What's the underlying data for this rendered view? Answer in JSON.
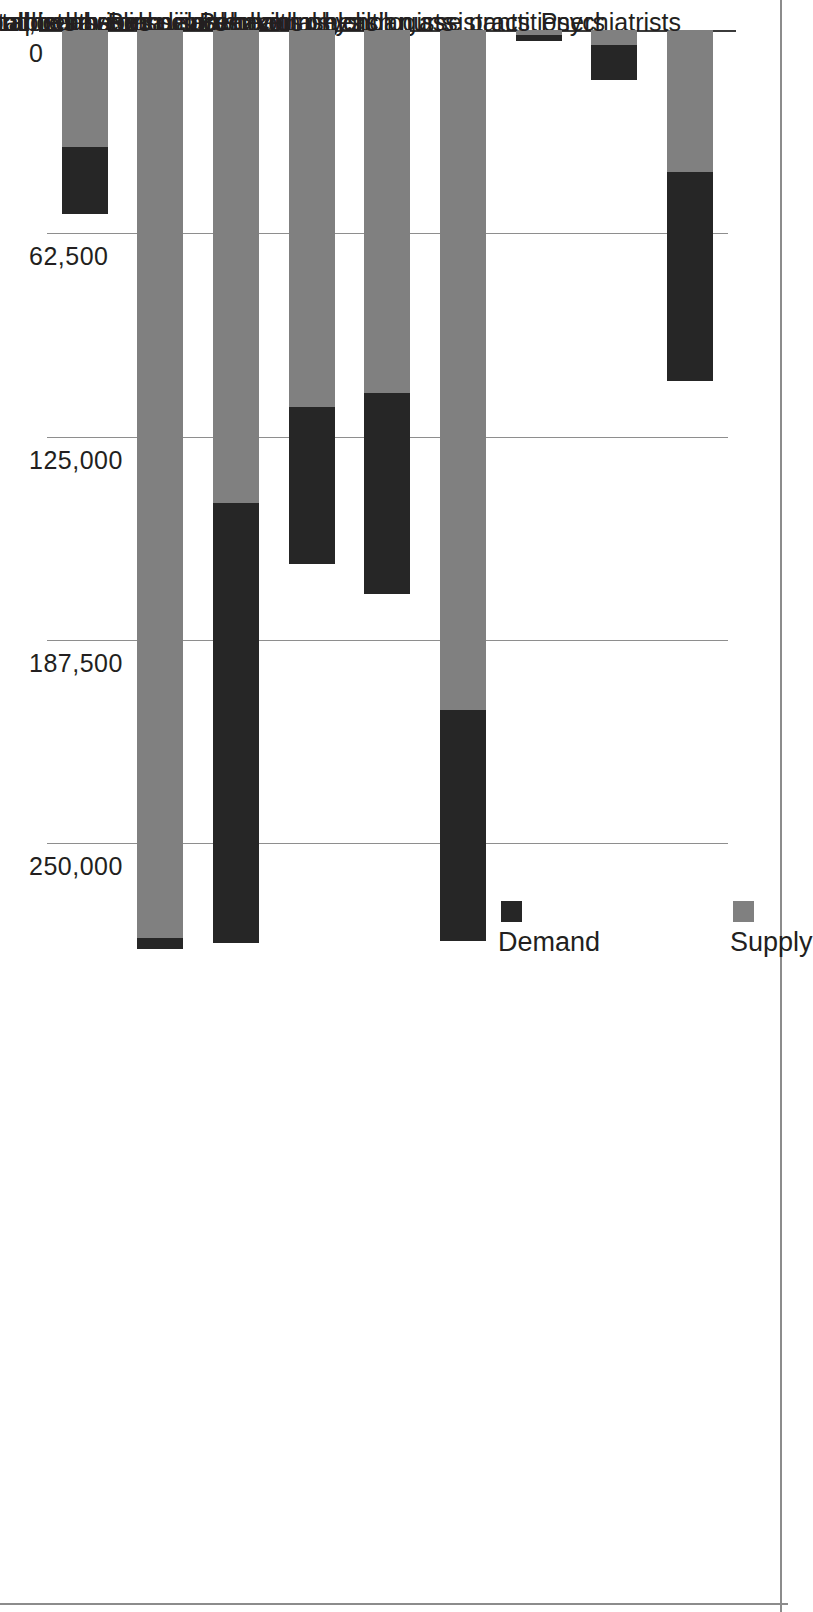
{
  "chart_data": {
    "type": "bar",
    "subtype": "stacked-bar",
    "orientation": "vertical-rotated",
    "title": "",
    "subtitle": "",
    "xlabel": "",
    "ylabel": "",
    "grid": true,
    "legend_position": "top-left",
    "ylim": [
      0,
      280000
    ],
    "categories": [
      "Psychiatrists",
      "Behavioral health nurse practitioners",
      "Behavioral health physician assistants",
      "Clinical, counseling, and school psychologists",
      "Substance abuse and behavioral disorder counselors",
      "Mental health and substance abuse social workers",
      "Mental health counselors",
      "School counselors",
      "Marriage and family therapists"
    ],
    "series": [
      {
        "name": "Supply",
        "color": "#808080",
        "values": [
          43500,
          4500,
          1500,
          209000,
          111500,
          116000,
          145500,
          279000,
          36000
        ]
      },
      {
        "name": "Demand",
        "color": "#262626",
        "values": [
          64500,
          11000,
          2000,
          71000,
          62000,
          48000,
          135000,
          3500,
          20500
        ]
      }
    ],
    "totals": [
      108000,
      15500,
      3500,
      280000,
      173500,
      164000,
      280500,
      282500,
      56500
    ],
    "ticks": [
      {
        "label": "0",
        "value": 0
      },
      {
        "label": "62,500",
        "value": 62500
      },
      {
        "label": "125,000",
        "value": 125000
      },
      {
        "label": "187,500",
        "value": 187500
      },
      {
        "label": "250,000",
        "value": 250000
      }
    ]
  },
  "legend": {
    "items": [
      {
        "label": "Supply",
        "color": "#808080"
      },
      {
        "label": "Demand",
        "color": "#262626"
      }
    ]
  }
}
